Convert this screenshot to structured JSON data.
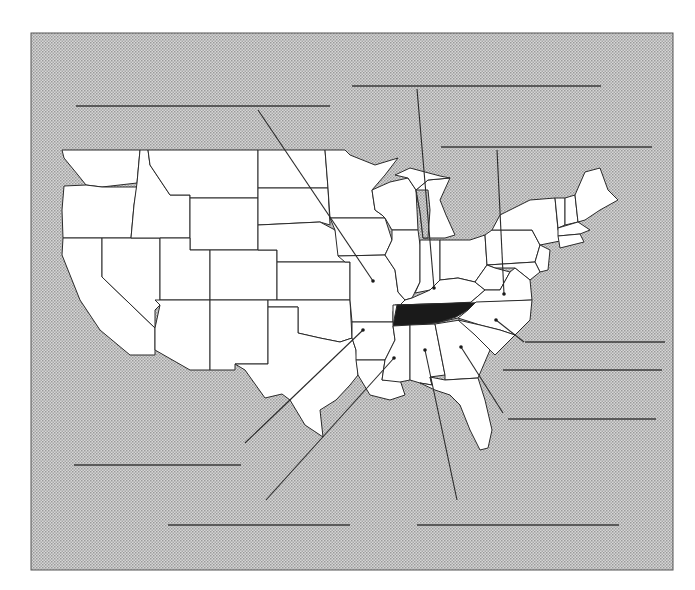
{
  "map": {
    "title": "United States map — Tennessee and neighboring states",
    "highlighted_state": "Tennessee",
    "colors": {
      "background_pattern": "#c8c8c8",
      "land": "#ffffff",
      "highlight": "#1a1a1a",
      "lines": "#2a2a2a"
    },
    "answer_blanks": [
      {
        "id": "missouri",
        "value": ""
      },
      {
        "id": "kentucky",
        "value": ""
      },
      {
        "id": "virginia",
        "value": ""
      },
      {
        "id": "north-carolina",
        "value": ""
      },
      {
        "id": "georgia",
        "value": ""
      },
      {
        "id": "georgia-coast",
        "value": ""
      },
      {
        "id": "arkansas",
        "value": ""
      },
      {
        "id": "mississippi",
        "value": ""
      },
      {
        "id": "alabama",
        "value": ""
      }
    ]
  }
}
